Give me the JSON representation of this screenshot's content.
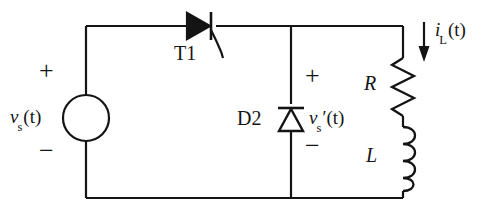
{
  "figure": {
    "line_color": "#141414",
    "background": "#ffffff"
  },
  "source": {
    "name": "voltage-source",
    "plus_sign": "+",
    "minus_sign": "−",
    "label_var": "v",
    "label_sub": "s",
    "label_arg": "(t)"
  },
  "thyristor": {
    "name": "T1",
    "label": "T1"
  },
  "diode": {
    "name": "D2",
    "label": "D2"
  },
  "output_voltage": {
    "plus_sign": "+",
    "minus_sign": "−",
    "label_var": "v",
    "label_sub": "s",
    "label_prime": "′",
    "label_arg": "(t)"
  },
  "resistor": {
    "label": "R"
  },
  "inductor": {
    "label": "L"
  },
  "load_current": {
    "label_var": "i",
    "label_sub": "L",
    "label_arg": "(t)",
    "direction": "down"
  }
}
